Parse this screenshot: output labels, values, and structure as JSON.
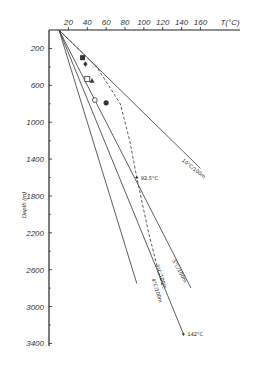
{
  "chart_data": {
    "type": "line",
    "title": "",
    "xlabel": "T(°C)",
    "ylabel": "Depth (m)",
    "x_ticks": [
      "20",
      "40",
      "60",
      "80",
      "100",
      "120",
      "140",
      "160"
    ],
    "y_ticks": [
      "200",
      "600",
      "1000",
      "1400",
      "1800",
      "2200",
      "2600",
      "3000",
      "3400"
    ],
    "xlim": [
      10,
      170
    ],
    "ylim": [
      0,
      3400
    ],
    "x_axis_position": "top",
    "y_inverted": true,
    "grid": false,
    "series": [
      {
        "name": "10°C/100m",
        "style": "solid",
        "points": [
          [
            10,
            0
          ],
          [
            160,
            1500
          ]
        ]
      },
      {
        "name": "5°C/100m",
        "style": "solid",
        "points": [
          [
            10,
            0
          ],
          [
            150,
            2800
          ]
        ]
      },
      {
        "name": "4°C/100m",
        "style": "solid",
        "points": [
          [
            10,
            0
          ],
          [
            142,
            3300
          ]
        ]
      },
      {
        "name": "3°C/100m",
        "style": "solid",
        "points": [
          [
            10,
            0
          ],
          [
            92.5,
            2750
          ]
        ]
      },
      {
        "name": "measured profile",
        "style": "dashed",
        "points": [
          [
            10,
            0
          ],
          [
            50,
            400
          ],
          [
            75,
            800
          ],
          [
            85,
            1200
          ],
          [
            92.5,
            1600
          ],
          [
            105,
            2200
          ],
          [
            120,
            2800
          ]
        ]
      }
    ],
    "annotations": [
      {
        "text": "10°C/100m",
        "x": 140,
        "y": 1420
      },
      {
        "text": "5°C/100m",
        "x": 130,
        "y": 2500
      },
      {
        "text": "3°C/100m",
        "x": 112,
        "y": 2550
      },
      {
        "text": "4°C/100m",
        "x": 108,
        "y": 2700
      },
      {
        "text": "92.5°C",
        "x": 92.5,
        "y": 1600
      },
      {
        "text": "142°C",
        "x": 142,
        "y": 3300
      }
    ],
    "markers": [
      {
        "shape": "filled-square",
        "x": 35,
        "y": 300
      },
      {
        "shape": "filled-diamond",
        "x": 38,
        "y": 370
      },
      {
        "shape": "open-star",
        "x": 48,
        "y": 380
      },
      {
        "shape": "open-square",
        "x": 40,
        "y": 530
      },
      {
        "shape": "filled-triangle",
        "x": 45,
        "y": 550
      },
      {
        "shape": "open-circle",
        "x": 48,
        "y": 760
      },
      {
        "shape": "filled-circle",
        "x": 60,
        "y": 790
      }
    ]
  }
}
